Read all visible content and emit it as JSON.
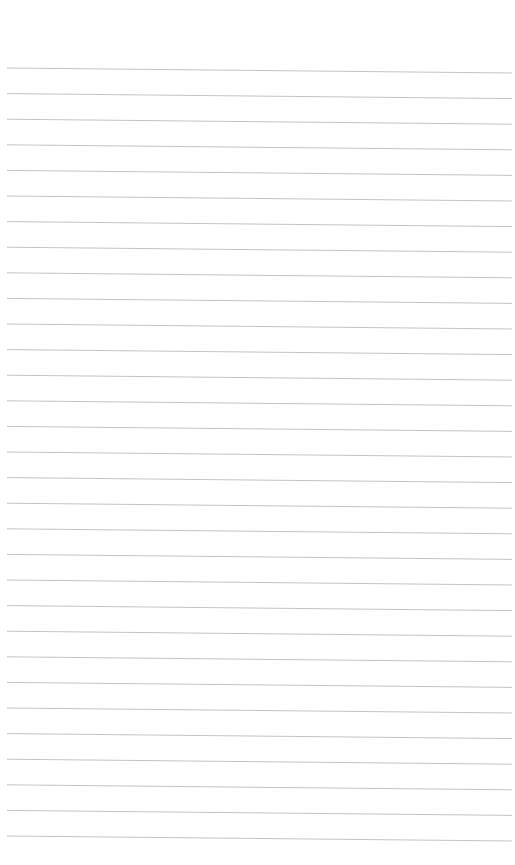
{
  "page": {
    "type": "lined-paper",
    "background_color": "#ffffff",
    "line_color": "#c4c4c4",
    "line_count": 31,
    "first_line_y": 68,
    "line_spacing": 25.6,
    "line_start_x": 7,
    "line_end_x": 512,
    "line_slope_px": 5,
    "text": ""
  }
}
